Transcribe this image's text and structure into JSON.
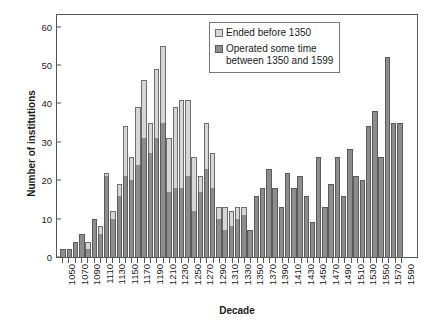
{
  "chart_data": {
    "type": "bar",
    "title": "",
    "subtitle": "",
    "xlabel": "Decade",
    "ylabel": "Number of institutions",
    "ylim": [
      0,
      63
    ],
    "yticks": [
      0,
      10,
      20,
      30,
      40,
      50,
      60
    ],
    "ytick_labels": [
      "0",
      "10",
      "20",
      "30",
      "40",
      "50",
      "60"
    ],
    "grid": false,
    "stacked": true,
    "legend_position": "top-right",
    "legend": [
      "Ended before 1350",
      "Operated some time\nbetween 1350 and 1599"
    ],
    "colors": {
      "ended_before_1350": "#d6d6d6",
      "operated_1350_1599": "#8d8d8d",
      "axis": "#555555",
      "text": "#1a1a1a",
      "background": "#ffffff"
    },
    "categories": [
      "1050",
      "1060",
      "1070",
      "1080",
      "1090",
      "1100",
      "1110",
      "1120",
      "1130",
      "1140",
      "1150",
      "1160",
      "1170",
      "1180",
      "1190",
      "1200",
      "1210",
      "1220",
      "1230",
      "1240",
      "1250",
      "1260",
      "1270",
      "1280",
      "1290",
      "1300",
      "1310",
      "1320",
      "1330",
      "1340",
      "1350",
      "1360",
      "1370",
      "1380",
      "1390",
      "1400",
      "1410",
      "1420",
      "1430",
      "1440",
      "1450",
      "1460",
      "1470",
      "1480",
      "1490",
      "1500",
      "1510",
      "1520",
      "1530",
      "1540",
      "1550",
      "1560",
      "1570",
      "1580",
      "1590"
    ],
    "xtick_labels": [
      "1050",
      "1070",
      "1090",
      "1110",
      "1130",
      "1150",
      "1170",
      "1190",
      "1210",
      "1230",
      "1250",
      "1270",
      "1290",
      "1310",
      "1330",
      "1350",
      "1370",
      "1390",
      "1410",
      "1430",
      "1450",
      "1470",
      "1490",
      "1510",
      "1530",
      "1550",
      "1570",
      "1590"
    ],
    "series": [
      {
        "name": "Operated some time between 1350 and 1599",
        "color": "#8d8d8d",
        "values": [
          2,
          2,
          4,
          6,
          2,
          10,
          6,
          21,
          10,
          16,
          21,
          20,
          24,
          31,
          27,
          31,
          35,
          17,
          18,
          18,
          21,
          12,
          17,
          23,
          18,
          10,
          7,
          8,
          10,
          11,
          7,
          16,
          18,
          23,
          18,
          13,
          22,
          18,
          21,
          16,
          9,
          26,
          13,
          19,
          26,
          16,
          28,
          21,
          20,
          34,
          38,
          26,
          52,
          35,
          35
        ]
      },
      {
        "name": "Ended before 1350",
        "color": "#d6d6d6",
        "values": [
          0,
          0,
          0,
          0,
          2,
          0,
          2,
          1,
          2,
          3,
          13,
          6,
          15,
          15,
          8,
          18,
          20,
          14,
          21,
          23,
          20,
          14,
          4,
          12,
          9,
          3,
          6,
          4,
          3,
          2,
          0,
          0,
          0,
          0,
          0,
          0,
          0,
          0,
          0,
          0,
          0,
          0,
          0,
          0,
          0,
          0,
          0,
          0,
          0,
          0,
          0,
          0,
          0,
          0,
          0
        ]
      }
    ],
    "totals": [
      2,
      2,
      4,
      6,
      4,
      10,
      8,
      22,
      12,
      19,
      34,
      26,
      39,
      46,
      35,
      49,
      55,
      31,
      39,
      41,
      41,
      26,
      21,
      35,
      27,
      13,
      13,
      12,
      13,
      13,
      7,
      16,
      18,
      23,
      18,
      13,
      22,
      18,
      21,
      16,
      9,
      26,
      13,
      19,
      26,
      16,
      28,
      21,
      20,
      34,
      38,
      26,
      52,
      35,
      35
    ]
  }
}
